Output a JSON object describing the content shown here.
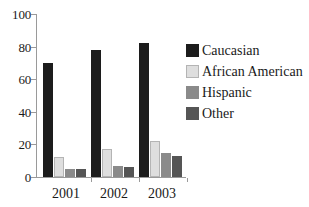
{
  "chart_data": {
    "type": "bar",
    "title": "",
    "subtitle": "",
    "xlabel": "",
    "ylabel": "",
    "categories": [
      "2001",
      "2002",
      "2003"
    ],
    "series": [
      {
        "name": "Caucasian",
        "color": "#1c1c1c",
        "values": [
          70,
          78,
          82
        ]
      },
      {
        "name": "African American",
        "color": "#dedede",
        "values": [
          12,
          17,
          22
        ]
      },
      {
        "name": "Hispanic",
        "color": "#8a8a8a",
        "values": [
          5,
          7,
          15
        ]
      },
      {
        "name": "Other",
        "color": "#555555",
        "values": [
          5,
          6,
          13
        ]
      }
    ],
    "ylim": [
      0,
      100
    ],
    "yticks": [
      0,
      20,
      40,
      60,
      80,
      100
    ],
    "ytick_labels": [
      "0",
      "20",
      "40",
      "60",
      "80",
      "100"
    ],
    "grid": false,
    "legend_position": "right"
  },
  "axes": {
    "y_tick_labels": [
      "100",
      "80",
      "60",
      "40",
      "20",
      "0"
    ],
    "x_tick_labels": [
      "2001",
      "2002",
      "2003"
    ]
  },
  "legend": {
    "items": [
      {
        "label": "Caucasian",
        "swatch": "legend-swatch-caucasian"
      },
      {
        "label": "African American",
        "swatch": "legend-swatch-african-american"
      },
      {
        "label": "Hispanic",
        "swatch": "legend-swatch-hispanic"
      },
      {
        "label": "Other",
        "swatch": "legend-swatch-other"
      }
    ]
  }
}
